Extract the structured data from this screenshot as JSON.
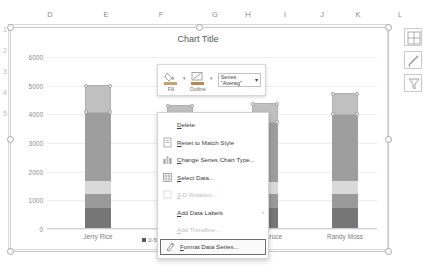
{
  "spreadsheet": {
    "column_headers": [
      "D",
      "E",
      "F",
      "G",
      "H",
      "I",
      "J",
      "K",
      "L"
    ],
    "row_numbers": [
      "1",
      "2",
      "3",
      "4",
      "5"
    ]
  },
  "chart": {
    "title": "Chart Title",
    "y_ticks": [
      "6000",
      "5000",
      "4000",
      "3000",
      "2000",
      "1000",
      "0"
    ],
    "categories": [
      "Jerry Rice",
      "Larry Fit",
      "Isaac Bruce",
      "Randy Moss"
    ],
    "legend": [
      {
        "label": "0-500",
        "color": "#595959"
      },
      {
        "label": "500",
        "color": "#8c8c8c"
      },
      {
        "label": "Best",
        "color": "#a6a6a6"
      },
      {
        "label": "Average",
        "color": "#bfbfbf"
      }
    ]
  },
  "chart_data": {
    "type": "bar",
    "title": "Chart Title",
    "xlabel": "",
    "ylabel": "",
    "ylim": [
      0,
      6000
    ],
    "grid": true,
    "legend_position": "bottom",
    "categories": [
      "Jerry Rice",
      "Larry Fit",
      "Isaac Bruce",
      "Randy Moss"
    ],
    "series": [
      {
        "name": "0-500",
        "color": "#767676",
        "values": [
          700,
          680,
          690,
          700
        ]
      },
      {
        "name": "500",
        "color": "#9a9a9a",
        "values": [
          500,
          480,
          490,
          500
        ]
      },
      {
        "name": "Best",
        "color": "#d9d9d9",
        "values": [
          450,
          430,
          440,
          450
        ]
      },
      {
        "name": "Average",
        "color": "#9e9e9e",
        "values": [
          2350,
          2000,
          2050,
          2300
        ]
      },
      {
        "name": "Top",
        "color": "#c0c0c0",
        "values": [
          1000,
          700,
          700,
          750
        ]
      }
    ]
  },
  "mini_toolbar": {
    "fill_label": "Fill",
    "outline_label": "Outline",
    "series_selector": "Series \"Averag\""
  },
  "context_menu": {
    "items": [
      {
        "label": "Delete",
        "icon": "none",
        "disabled": false,
        "submenu": false,
        "highlighted": false
      },
      {
        "label": "Reset to Match Style",
        "icon": "reset-icon",
        "disabled": false,
        "submenu": false,
        "highlighted": false
      },
      {
        "label": "Change Series Chart Type...",
        "icon": "chart-type-icon",
        "disabled": false,
        "submenu": false,
        "highlighted": false
      },
      {
        "label": "Select Data...",
        "icon": "select-data-icon",
        "disabled": false,
        "submenu": false,
        "highlighted": false
      },
      {
        "label": "3-D Rotation...",
        "icon": "rotation-icon",
        "disabled": true,
        "submenu": false,
        "highlighted": false
      },
      {
        "label": "Add Data Labels",
        "icon": "none",
        "disabled": false,
        "submenu": true,
        "highlighted": false
      },
      {
        "label": "Add Trendline...",
        "icon": "none",
        "disabled": true,
        "submenu": false,
        "highlighted": false
      },
      {
        "label": "Format Data Series...",
        "icon": "format-icon",
        "disabled": false,
        "submenu": false,
        "highlighted": true
      }
    ]
  },
  "side_buttons": [
    {
      "name": "chart-elements-button",
      "icon": "plus-icon"
    },
    {
      "name": "chart-styles-button",
      "icon": "brush-icon"
    },
    {
      "name": "chart-filters-button",
      "icon": "funnel-icon"
    }
  ]
}
